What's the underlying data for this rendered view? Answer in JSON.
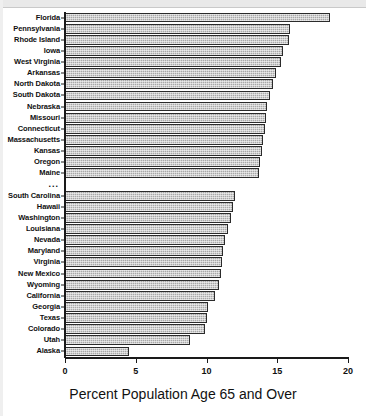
{
  "chart_data": {
    "type": "bar",
    "orientation": "horizontal",
    "title": "",
    "xlabel": "Percent Population Age 65 and Over",
    "ylabel": "",
    "xlim": [
      0,
      20
    ],
    "xticks": [
      0,
      5,
      10,
      15,
      20
    ],
    "xtick_labels": [
      "0",
      "5",
      "10",
      "15",
      "20"
    ],
    "grid": false,
    "legend": null,
    "break_marker": "...",
    "groups": [
      {
        "name": "highest",
        "categories": [
          "Florida",
          "Pennsylvania",
          "Rhode Island",
          "Iowa",
          "West Virginia",
          "Arkansas",
          "North Dakota",
          "South Dakota",
          "Nebraska",
          "Missouri",
          "Connecticut",
          "Massachusetts",
          "Kansas",
          "Oregon",
          "Maine"
        ],
        "values": [
          18.7,
          15.9,
          15.8,
          15.4,
          15.3,
          14.9,
          14.7,
          14.5,
          14.3,
          14.2,
          14.1,
          14.0,
          13.9,
          13.8,
          13.7
        ]
      },
      {
        "name": "lowest",
        "categories": [
          "South Carolina",
          "Hawaii",
          "Washington",
          "Louisiana",
          "Nevada",
          "Maryland",
          "Virginia",
          "New Mexico",
          "Wyoming",
          "California",
          "Georgia",
          "Texas",
          "Colorado",
          "Utah",
          "Alaska"
        ],
        "values": [
          12.0,
          11.9,
          11.7,
          11.5,
          11.3,
          11.2,
          11.1,
          11.0,
          10.9,
          10.6,
          10.1,
          10.0,
          9.9,
          8.8,
          4.5
        ]
      }
    ],
    "categories": [
      "Florida",
      "Pennsylvania",
      "Rhode Island",
      "Iowa",
      "West Virginia",
      "Arkansas",
      "North Dakota",
      "South Dakota",
      "Nebraska",
      "Missouri",
      "Connecticut",
      "Massachusetts",
      "Kansas",
      "Oregon",
      "Maine",
      "South Carolina",
      "Hawaii",
      "Washington",
      "Louisiana",
      "Nevada",
      "Maryland",
      "Virginia",
      "New Mexico",
      "Wyoming",
      "California",
      "Georgia",
      "Texas",
      "Colorado",
      "Utah",
      "Alaska"
    ],
    "values": [
      18.7,
      15.9,
      15.8,
      15.4,
      15.3,
      14.9,
      14.7,
      14.5,
      14.3,
      14.2,
      14.1,
      14.0,
      13.9,
      13.8,
      13.7,
      12.0,
      11.9,
      11.7,
      11.5,
      11.3,
      11.2,
      11.1,
      11.0,
      10.9,
      10.6,
      10.1,
      10.0,
      9.9,
      8.8,
      4.5
    ],
    "colors": {
      "bar_fill": "#a8a8a8",
      "bar_edge": "#2b2b2b",
      "axis": "#1a1a1a",
      "text": "#101010",
      "background": "#ffffff"
    }
  }
}
